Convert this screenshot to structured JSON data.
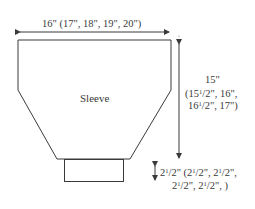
{
  "diagram": {
    "piece_label": "Sleeve",
    "width_measurement": "16\" (17\", 18\", 19\", 20\")",
    "length_measurement": {
      "line1": "15\"",
      "line2": "(15 1/2\", 16\",",
      "line3": "16 1/2\", 17\")"
    },
    "cuff_measurement": {
      "line1": "2 1/2\" (2 1/2\", 2 1/2\",",
      "line2": "2 1/2\", 2 1/2\", )"
    },
    "colors": {
      "stroke": "#3a3a3a",
      "background": "#ffffff"
    }
  }
}
